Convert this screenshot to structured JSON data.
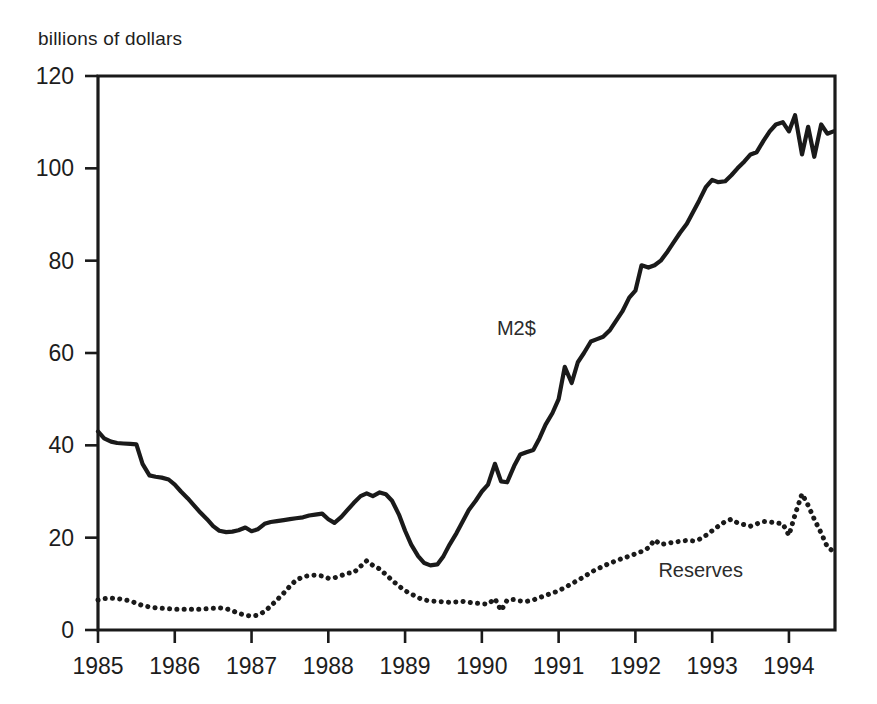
{
  "chart_data": {
    "type": "line",
    "title": "",
    "ylabel": "billions of dollars",
    "xlabel": "",
    "ylim": [
      0,
      120
    ],
    "xlim": [
      1985.0,
      1994.6
    ],
    "yticks": [
      0,
      20,
      40,
      60,
      80,
      100,
      120
    ],
    "xticks": [
      1985,
      1986,
      1987,
      1988,
      1989,
      1990,
      1991,
      1992,
      1993,
      1994
    ],
    "ytick_labels": [
      "0",
      "20",
      "40",
      "60",
      "80",
      "100",
      "120"
    ],
    "xtick_labels": [
      "1985",
      "1986",
      "1987",
      "1988",
      "1989",
      "1990",
      "1991",
      "1992",
      "1993",
      "1994"
    ],
    "grid": false,
    "legend": "inline-annotations",
    "annotations": [
      {
        "text": "M2$",
        "x": 1990.45,
        "y": 64.0
      },
      {
        "text": "Reserves",
        "x": 1992.85,
        "y": 11.5
      }
    ],
    "series": [
      {
        "name": "M2$",
        "style": "solid",
        "color": "#1a1a1a",
        "linewidth": 4.2,
        "x": [
          1985.0,
          1985.08,
          1985.17,
          1985.25,
          1985.33,
          1985.42,
          1985.5,
          1985.58,
          1985.67,
          1985.75,
          1985.83,
          1985.92,
          1986.0,
          1986.08,
          1986.17,
          1986.25,
          1986.33,
          1986.42,
          1986.5,
          1986.58,
          1986.67,
          1986.75,
          1986.83,
          1986.92,
          1987.0,
          1987.08,
          1987.17,
          1987.25,
          1987.33,
          1987.42,
          1987.5,
          1987.58,
          1987.67,
          1987.75,
          1987.83,
          1987.92,
          1988.0,
          1988.08,
          1988.17,
          1988.25,
          1988.33,
          1988.42,
          1988.5,
          1988.58,
          1988.67,
          1988.75,
          1988.83,
          1988.92,
          1989.0,
          1989.08,
          1989.17,
          1989.25,
          1989.33,
          1989.42,
          1989.5,
          1989.58,
          1989.67,
          1989.75,
          1989.83,
          1989.92,
          1990.0,
          1990.08,
          1990.17,
          1990.25,
          1990.33,
          1990.42,
          1990.5,
          1990.58,
          1990.67,
          1990.75,
          1990.83,
          1990.92,
          1991.0,
          1991.08,
          1991.17,
          1991.25,
          1991.33,
          1991.42,
          1991.5,
          1991.58,
          1991.67,
          1991.75,
          1991.83,
          1991.92,
          1992.0,
          1992.08,
          1992.17,
          1992.25,
          1992.33,
          1992.42,
          1992.5,
          1992.58,
          1992.67,
          1992.75,
          1992.83,
          1992.92,
          1993.0,
          1993.08,
          1993.17,
          1993.25,
          1993.33,
          1993.42,
          1993.5,
          1993.58,
          1993.67,
          1993.75,
          1993.83,
          1993.92,
          1994.0,
          1994.08,
          1994.17,
          1994.25,
          1994.33,
          1994.42,
          1994.5,
          1994.58
        ],
        "values": [
          43.0,
          41.5,
          40.8,
          40.5,
          40.4,
          40.3,
          40.2,
          36.0,
          33.5,
          33.2,
          33.0,
          32.6,
          31.5,
          30.0,
          28.5,
          27.0,
          25.5,
          24.0,
          22.5,
          21.5,
          21.2,
          21.3,
          21.6,
          22.2,
          21.4,
          21.8,
          23.0,
          23.4,
          23.6,
          23.8,
          24.0,
          24.2,
          24.4,
          24.8,
          25.0,
          25.2,
          24.0,
          23.2,
          24.5,
          26.0,
          27.5,
          29.0,
          29.6,
          29.0,
          29.8,
          29.4,
          28.0,
          25.0,
          21.5,
          18.5,
          16.0,
          14.5,
          14.0,
          14.2,
          16.0,
          18.5,
          21.0,
          23.5,
          26.0,
          28.0,
          30.0,
          31.5,
          36.0,
          32.2,
          32.0,
          35.5,
          38.0,
          38.5,
          39.0,
          41.5,
          44.5,
          47.0,
          50.0,
          57.0,
          53.5,
          58.0,
          60.0,
          62.5,
          63.0,
          63.5,
          65.0,
          67.0,
          69.0,
          72.0,
          73.5,
          79.0,
          78.5,
          79.0,
          80.0,
          82.0,
          84.0,
          86.0,
          88.0,
          90.5,
          93.0,
          96.0,
          97.5,
          97.0,
          97.2,
          98.5,
          100.0,
          101.5,
          103.0,
          103.5,
          106.0,
          108.0,
          109.5,
          110.0,
          108.0,
          111.5,
          103.0,
          109.0,
          102.5,
          109.5,
          107.5,
          108.0
        ]
      },
      {
        "name": "Reserves",
        "style": "dotted",
        "color": "#1a1a1a",
        "linewidth": 4.2,
        "x": [
          1985.0,
          1985.08,
          1985.17,
          1985.25,
          1985.33,
          1985.42,
          1985.5,
          1985.58,
          1985.67,
          1985.75,
          1985.83,
          1985.92,
          1986.0,
          1986.08,
          1986.17,
          1986.25,
          1986.33,
          1986.42,
          1986.5,
          1986.58,
          1986.67,
          1986.75,
          1986.83,
          1986.92,
          1987.0,
          1987.08,
          1987.17,
          1987.25,
          1987.33,
          1987.42,
          1987.5,
          1987.58,
          1987.67,
          1987.75,
          1987.83,
          1987.92,
          1988.0,
          1988.08,
          1988.17,
          1988.25,
          1988.33,
          1988.42,
          1988.5,
          1988.58,
          1988.67,
          1988.75,
          1988.83,
          1988.92,
          1989.0,
          1989.08,
          1989.17,
          1989.25,
          1989.33,
          1989.42,
          1989.5,
          1989.58,
          1989.67,
          1989.75,
          1989.83,
          1989.92,
          1990.0,
          1990.08,
          1990.17,
          1990.25,
          1990.33,
          1990.42,
          1990.5,
          1990.58,
          1990.67,
          1990.75,
          1990.83,
          1990.92,
          1991.0,
          1991.08,
          1991.17,
          1991.25,
          1991.33,
          1991.42,
          1991.5,
          1991.58,
          1991.67,
          1991.75,
          1991.83,
          1991.92,
          1992.0,
          1992.08,
          1992.17,
          1992.25,
          1992.33,
          1992.42,
          1992.5,
          1992.58,
          1992.67,
          1992.75,
          1992.83,
          1992.92,
          1993.0,
          1993.08,
          1993.17,
          1993.25,
          1993.33,
          1993.42,
          1993.5,
          1993.58,
          1993.67,
          1993.75,
          1993.83,
          1993.92,
          1994.0,
          1994.08,
          1994.17,
          1994.25,
          1994.33,
          1994.42,
          1994.5,
          1994.58
        ],
        "values": [
          6.5,
          6.8,
          6.9,
          6.8,
          6.6,
          6.3,
          5.8,
          5.3,
          5.0,
          4.8,
          4.7,
          4.6,
          4.5,
          4.5,
          4.5,
          4.5,
          4.5,
          4.6,
          4.7,
          4.8,
          4.6,
          4.2,
          3.6,
          3.2,
          3.0,
          3.2,
          4.0,
          5.2,
          6.5,
          8.0,
          9.5,
          10.8,
          11.5,
          11.8,
          11.9,
          11.7,
          11.2,
          11.3,
          11.8,
          12.3,
          12.4,
          13.8,
          15.0,
          14.0,
          13.2,
          12.0,
          10.8,
          9.5,
          8.5,
          7.8,
          7.0,
          6.5,
          6.3,
          6.2,
          6.1,
          6.0,
          6.1,
          6.2,
          6.0,
          5.8,
          5.7,
          5.6,
          6.8,
          4.2,
          6.5,
          6.6,
          6.3,
          6.2,
          6.5,
          7.0,
          7.5,
          8.0,
          8.5,
          9.2,
          10.0,
          10.8,
          11.5,
          12.5,
          13.2,
          13.8,
          14.5,
          15.0,
          15.5,
          16.0,
          16.5,
          17.0,
          17.8,
          19.5,
          18.5,
          18.8,
          19.0,
          19.2,
          19.4,
          19.3,
          19.6,
          20.5,
          21.5,
          22.5,
          23.5,
          24.0,
          23.2,
          22.8,
          22.5,
          23.0,
          23.5,
          23.4,
          23.2,
          23.0,
          20.5,
          25.0,
          29.5,
          27.0,
          24.0,
          21.0,
          18.0,
          17.0
        ]
      }
    ]
  }
}
